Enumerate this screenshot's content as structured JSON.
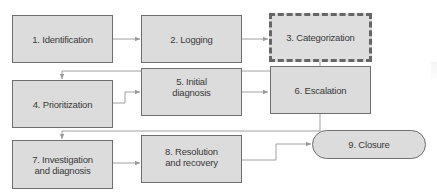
{
  "diagram": {
    "type": "flowchart",
    "title": "",
    "colors": {
      "box_fill": "#dcdcdc",
      "box_border": "#6e6e6e",
      "connector": "#9a9a9a",
      "text": "#3a3a3a",
      "background": "#ffffff"
    },
    "nodes": [
      {
        "id": 1,
        "label": "1. Identification",
        "shape": "rectangle",
        "style": "solid"
      },
      {
        "id": 2,
        "label": "2. Logging",
        "shape": "rectangle",
        "style": "solid"
      },
      {
        "id": 3,
        "label": "3. Categorization",
        "shape": "rectangle",
        "style": "dashed-thick"
      },
      {
        "id": 4,
        "label": "4. Prioritization",
        "shape": "rectangle",
        "style": "solid"
      },
      {
        "id": 5,
        "label": "5. Initial\ndiagnosis",
        "shape": "rectangle",
        "style": "solid"
      },
      {
        "id": 6,
        "label": "6. Escalation",
        "shape": "rectangle",
        "style": "solid"
      },
      {
        "id": 7,
        "label": "7. Investigation\nand diagnosis",
        "shape": "rectangle",
        "style": "solid"
      },
      {
        "id": 8,
        "label": "8. Resolution\nand recovery",
        "shape": "rectangle",
        "style": "solid"
      },
      {
        "id": 9,
        "label": "9. Closure",
        "shape": "rounded-pill",
        "style": "solid"
      }
    ],
    "edges": [
      {
        "from": 1,
        "to": 2
      },
      {
        "from": 2,
        "to": 3
      },
      {
        "from": 3,
        "to": 4
      },
      {
        "from": 4,
        "to": 5
      },
      {
        "from": 5,
        "to": 6
      },
      {
        "from": 6,
        "to": 7
      },
      {
        "from": 7,
        "to": 8
      },
      {
        "from": 8,
        "to": 9
      }
    ]
  }
}
